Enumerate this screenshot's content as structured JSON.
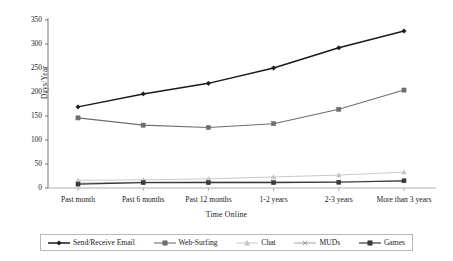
{
  "chart_data": {
    "type": "line",
    "title": "",
    "xlabel": "Time Online",
    "ylabel": "Days/Year",
    "categories": [
      "Past month",
      "Past 6 months",
      "Past 12 months",
      "1-2 years",
      "2-3 years",
      "More than 3 years"
    ],
    "ylim": [
      0,
      350
    ],
    "yticks": [
      0,
      50,
      100,
      150,
      200,
      250,
      300,
      350
    ],
    "grid": false,
    "legend_position": "bottom",
    "series": [
      {
        "name": "Send/Receive Email",
        "values": [
          169,
          196,
          218,
          250,
          292,
          327
        ],
        "color": "#1a1a1a",
        "marker": "diamond"
      },
      {
        "name": "Web-Surfing",
        "values": [
          146,
          131,
          126,
          134,
          164,
          204
        ],
        "color": "#6e6e6e",
        "marker": "square"
      },
      {
        "name": "Chat",
        "values": [
          16,
          17,
          19,
          23,
          27,
          33
        ],
        "color": "#c3c3c3",
        "marker": "triangle"
      },
      {
        "name": "MUDs",
        "values": [
          10,
          12,
          13,
          13,
          13,
          15
        ],
        "color": "#9b9b9b",
        "marker": "x"
      },
      {
        "name": "Games",
        "values": [
          8,
          11,
          11,
          11,
          12,
          15
        ],
        "color": "#3a3a3a",
        "marker": "square"
      }
    ]
  },
  "axis": {
    "y_title": "Days/Year",
    "x_title": "Time Online",
    "y_tick_labels": [
      "350",
      "300",
      "250",
      "200",
      "150",
      "100",
      "50",
      "0"
    ],
    "x_tick_labels": [
      "Past month",
      "Past 6 months",
      "Past 12 months",
      "1-2 years",
      "2-3 years",
      "More than 3 years"
    ]
  },
  "legend": {
    "entries": [
      {
        "label": "Send/Receive Email",
        "marker": "diamond-marker",
        "color": "#1a1a1a"
      },
      {
        "label": "Web-Surfing",
        "marker": "square-marker",
        "color": "#6e6e6e"
      },
      {
        "label": "Chat",
        "marker": "triangle-marker",
        "color": "#c3c3c3"
      },
      {
        "label": "MUDs",
        "marker": "x-marker",
        "color": "#9b9b9b"
      },
      {
        "label": "Games",
        "marker": "square-marker",
        "color": "#3a3a3a"
      }
    ]
  }
}
